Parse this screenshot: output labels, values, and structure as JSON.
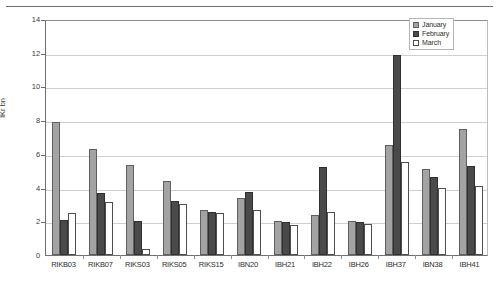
{
  "chart_data": {
    "type": "bar",
    "title": "",
    "subtitle": "",
    "xlabel": "",
    "ylabel": "ÍKr bn",
    "ylim": [
      0,
      14
    ],
    "ytick_step": 2,
    "yticks": [
      0,
      2,
      4,
      6,
      8,
      10,
      12,
      14
    ],
    "ytick_labels": [
      "0",
      "2",
      "4",
      "6",
      "8",
      "10",
      "12",
      "14"
    ],
    "grid": true,
    "legend_position": "top-right",
    "categories": [
      "RIKB03",
      "RIKB07",
      "RIKS03",
      "RIKS05",
      "RIKS15",
      "IBN20",
      "IBH21",
      "IBH22",
      "IBH26",
      "IBH37",
      "IBN38",
      "IBH41"
    ],
    "series": [
      {
        "name": "January",
        "color": "#a3a3a3",
        "values": [
          7.9,
          6.3,
          5.35,
          4.4,
          2.65,
          3.4,
          2.0,
          2.35,
          2.0,
          6.5,
          5.1,
          7.45
        ]
      },
      {
        "name": "February",
        "color": "#4a4a4a",
        "values": [
          2.1,
          3.65,
          2.0,
          3.2,
          2.55,
          3.75,
          1.95,
          5.25,
          1.95,
          11.85,
          4.65,
          5.3
        ]
      },
      {
        "name": "March",
        "color": "#ffffff",
        "values": [
          2.5,
          3.15,
          0.35,
          3.05,
          2.5,
          2.7,
          1.8,
          2.55,
          1.85,
          5.5,
          4.0,
          4.1
        ]
      }
    ]
  },
  "legend": {
    "items": [
      {
        "label": "January",
        "key": "january"
      },
      {
        "label": "February",
        "key": "february"
      },
      {
        "label": "March",
        "key": "march"
      }
    ]
  }
}
